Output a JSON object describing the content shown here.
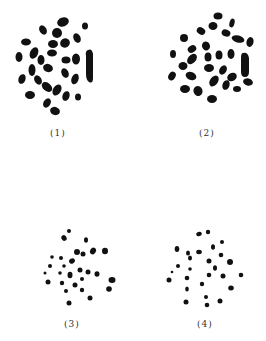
{
  "figure": {
    "panels": [
      {
        "id": 1,
        "label": "(1)",
        "label_x": 50,
        "label_y": 128
      },
      {
        "id": 2,
        "label": "(2)",
        "label_x": 199,
        "label_y": 128
      },
      {
        "id": 3,
        "label": "(3)",
        "label_x": 64,
        "label_y": 319
      },
      {
        "id": 4,
        "label": "(4)",
        "label_x": 197,
        "label_y": 319
      }
    ]
  },
  "colors": {
    "ink": "#111111",
    "background": "#ffffff"
  }
}
